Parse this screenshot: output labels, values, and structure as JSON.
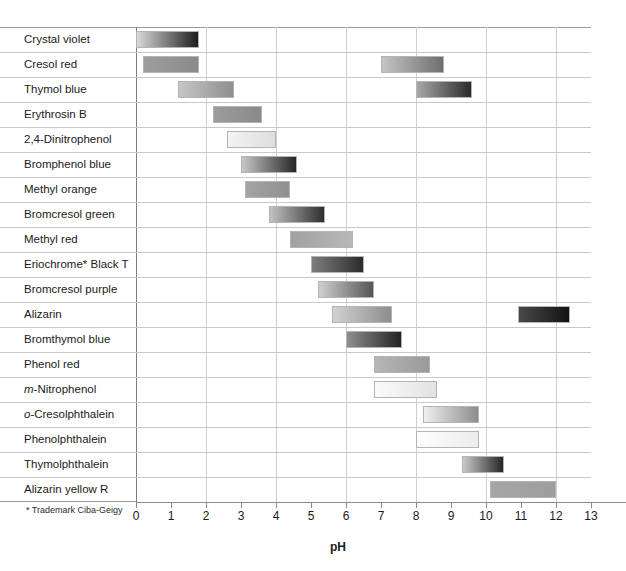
{
  "chart_data": {
    "type": "bar",
    "title": "",
    "subtitle": "",
    "xlabel": "pH",
    "ylabel": "",
    "xlim": [
      0,
      13
    ],
    "ylim": null,
    "grid": true,
    "grid_axis": "x",
    "grid_ticks": [
      0,
      2,
      4,
      6,
      8,
      10,
      12
    ],
    "legend": null,
    "orientation": "horizontal",
    "xticks": [
      "0",
      "1",
      "2",
      "3",
      "4",
      "5",
      "6",
      "7",
      "8",
      "9",
      "10",
      "11",
      "12",
      "13"
    ],
    "xtick_values": [
      0,
      1,
      2,
      3,
      4,
      5,
      6,
      7,
      8,
      9,
      10,
      11,
      12,
      13
    ],
    "annotation": "* Trademark Ciba-Geigy",
    "categories": [
      "Crystal violet",
      "Cresol red",
      "Thymol blue",
      "Erythrosin B",
      "2,4-Dinitrophenol",
      "Bromphenol blue",
      "Methyl orange",
      "Bromcresol green",
      "Methyl red",
      "Eriochrome* Black T",
      "Bromcresol purple",
      "Alizarin",
      "Bromthymol blue",
      "Phenol red",
      "m-Nitrophenol",
      "o-Cresolphthalein",
      "Phenolphthalein",
      "Thymolphthalein",
      "Alizarin yellow R"
    ],
    "indicators": [
      {
        "name": "Crystal violet",
        "italic_prefix": "",
        "ranges": [
          {
            "start": 0.0,
            "end": 1.8,
            "from": "#d9d9d9",
            "to": "#1c1c1c"
          }
        ]
      },
      {
        "name": "Cresol red",
        "italic_prefix": "",
        "ranges": [
          {
            "start": 0.2,
            "end": 1.8,
            "from": "#9e9e9e",
            "to": "#8a8a8a"
          },
          {
            "start": 7.0,
            "end": 8.8,
            "from": "#c4c4c4",
            "to": "#6f6f6f"
          }
        ]
      },
      {
        "name": "Thymol blue",
        "italic_prefix": "",
        "ranges": [
          {
            "start": 1.2,
            "end": 2.8,
            "from": "#c6c6c6",
            "to": "#8e8e8e"
          },
          {
            "start": 8.0,
            "end": 9.6,
            "from": "#a8a8a8",
            "to": "#2a2a2a"
          }
        ]
      },
      {
        "name": "Erythrosin B",
        "italic_prefix": "",
        "ranges": [
          {
            "start": 2.2,
            "end": 3.6,
            "from": "#9c9c9c",
            "to": "#898989"
          }
        ]
      },
      {
        "name": "2,4-Dinitrophenol",
        "italic_prefix": "",
        "ranges": [
          {
            "start": 2.6,
            "end": 4.0,
            "from": "#f3f3f3",
            "to": "#dedede"
          }
        ]
      },
      {
        "name": "Bromphenol blue",
        "italic_prefix": "",
        "ranges": [
          {
            "start": 3.0,
            "end": 4.6,
            "from": "#c7c7c7",
            "to": "#262626"
          }
        ]
      },
      {
        "name": "Methyl orange",
        "italic_prefix": "",
        "ranges": [
          {
            "start": 3.1,
            "end": 4.4,
            "from": "#a4a4a4",
            "to": "#909090"
          }
        ]
      },
      {
        "name": "Bromcresol green",
        "italic_prefix": "",
        "ranges": [
          {
            "start": 3.8,
            "end": 5.4,
            "from": "#c2c2c2",
            "to": "#2e2e2e"
          }
        ]
      },
      {
        "name": "Methyl red",
        "italic_prefix": "",
        "ranges": [
          {
            "start": 4.4,
            "end": 6.2,
            "from": "#a1a1a1",
            "to": "#b8b8b8"
          }
        ]
      },
      {
        "name": "Eriochrome* Black T",
        "italic_prefix": "",
        "ranges": [
          {
            "start": 5.0,
            "end": 6.5,
            "from": "#7e7e7e",
            "to": "#2b2b2b"
          }
        ]
      },
      {
        "name": "Bromcresol purple",
        "italic_prefix": "",
        "ranges": [
          {
            "start": 5.2,
            "end": 6.8,
            "from": "#cfcfcf",
            "to": "#555555"
          }
        ]
      },
      {
        "name": "Alizarin",
        "italic_prefix": "",
        "ranges": [
          {
            "start": 5.6,
            "end": 7.3,
            "from": "#d2d2d2",
            "to": "#8d8d8d"
          },
          {
            "start": 10.9,
            "end": 12.4,
            "from": "#494949",
            "to": "#121212"
          }
        ]
      },
      {
        "name": "Bromthymol blue",
        "italic_prefix": "",
        "ranges": [
          {
            "start": 6.0,
            "end": 7.6,
            "from": "#8f8f8f",
            "to": "#232323"
          }
        ]
      },
      {
        "name": "Phenol red",
        "italic_prefix": "",
        "ranges": [
          {
            "start": 6.8,
            "end": 8.4,
            "from": "#b6b6b6",
            "to": "#9a9a9a"
          }
        ]
      },
      {
        "name": "m-Nitrophenol",
        "italic_prefix": "m",
        "ranges": [
          {
            "start": 6.8,
            "end": 8.6,
            "from": "#fbfbfb",
            "to": "#e2e2e2"
          }
        ]
      },
      {
        "name": "o-Cresolphthalein",
        "italic_prefix": "o",
        "ranges": [
          {
            "start": 8.2,
            "end": 9.8,
            "from": "#efefef",
            "to": "#8c8c8c"
          }
        ]
      },
      {
        "name": "Phenolphthalein",
        "italic_prefix": "",
        "ranges": [
          {
            "start": 8.0,
            "end": 9.8,
            "from": "#fdfdfd",
            "to": "#ededed"
          }
        ]
      },
      {
        "name": "Thymolphthalein",
        "italic_prefix": "",
        "ranges": [
          {
            "start": 9.3,
            "end": 10.5,
            "from": "#c9c9c9",
            "to": "#252525"
          }
        ]
      },
      {
        "name": "Alizarin yellow R",
        "italic_prefix": "",
        "ranges": [
          {
            "start": 10.1,
            "end": 12.0,
            "from": "#a6a6a6",
            "to": "#9d9d9d"
          }
        ]
      }
    ]
  }
}
